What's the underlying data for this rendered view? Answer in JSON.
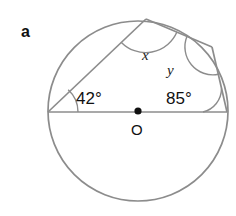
{
  "figure": {
    "part_label": "a",
    "center_label": "O",
    "stroke_color": "#8c8c8c",
    "text_color": "#111111",
    "background": "#ffffff",
    "circle": {
      "cx": 138,
      "cy": 111,
      "r": 90
    },
    "center_dot": {
      "cx": 138,
      "cy": 111,
      "r": 3.6
    },
    "vertices": {
      "left": {
        "x": 48,
        "y": 112,
        "name": "left-vertex"
      },
      "apex": {
        "x": 146,
        "y": 19,
        "name": "apex-vertex"
      },
      "upper_right": {
        "x": 212,
        "y": 47,
        "name": "upper-right-vertex"
      },
      "right": {
        "x": 227,
        "y": 112,
        "name": "right-vertex"
      }
    },
    "angles": [
      {
        "id": "angle-left",
        "label": "42°",
        "vertex": "left",
        "value": 42,
        "unit": "degrees"
      },
      {
        "id": "angle-apex",
        "label": "x",
        "vertex": "apex",
        "value": null,
        "unit": "unknown"
      },
      {
        "id": "angle-upper-right",
        "label": "y",
        "vertex": "upper_right",
        "value": null,
        "unit": "unknown"
      },
      {
        "id": "angle-right",
        "label": "85°",
        "vertex": "right",
        "value": 85,
        "unit": "degrees"
      }
    ],
    "label_positions": {
      "part_label": {
        "x": 21,
        "y": 24
      },
      "angle_left": {
        "x": 76,
        "y": 90
      },
      "angle_apex_x": {
        "x": 142,
        "y": 48
      },
      "angle_upper_right_y": {
        "x": 167,
        "y": 63
      },
      "angle_right": {
        "x": 166,
        "y": 90
      },
      "center_label": {
        "x": 131,
        "y": 122
      }
    }
  }
}
